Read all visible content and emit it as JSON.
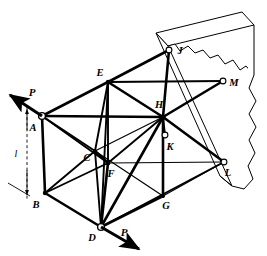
{
  "figure": {
    "type": "engineering-diagram",
    "background_color": "#ffffff",
    "line_color": "#000000"
  },
  "nodes": [
    {
      "id": "A",
      "label": "A",
      "x": 42,
      "y": 116,
      "label_x": 33,
      "label_y": 131,
      "marker": "pin",
      "note": "loaded joint, force P applied"
    },
    {
      "id": "B",
      "label": "B",
      "x": 45,
      "y": 193,
      "label_x": 36,
      "label_y": 208,
      "marker": "joint",
      "note": "lower left joint"
    },
    {
      "id": "C",
      "label": "C",
      "x": 95,
      "y": 151,
      "label_x": 87,
      "label_y": 161,
      "marker": "joint",
      "note": "interior upper joint"
    },
    {
      "id": "D",
      "label": "D",
      "x": 101,
      "y": 227,
      "label_x": 92,
      "label_y": 240,
      "marker": "pin",
      "note": "loaded joint, force P applied"
    },
    {
      "id": "E",
      "label": "E",
      "x": 108,
      "y": 82,
      "label_x": 99,
      "label_y": 76,
      "marker": "joint",
      "note": "top front joint"
    },
    {
      "id": "F",
      "label": "F",
      "x": 108,
      "y": 163,
      "label_x": 110,
      "label_y": 176,
      "marker": "joint",
      "note": "interior lower joint"
    },
    {
      "id": "G",
      "label": "G",
      "x": 163,
      "y": 196,
      "label_x": 165,
      "label_y": 208,
      "marker": "joint",
      "note": "lower rear joint"
    },
    {
      "id": "H",
      "label": "H",
      "x": 163,
      "y": 117,
      "label_x": 157,
      "label_y": 108,
      "marker": "joint",
      "note": "central upper rear joint"
    },
    {
      "id": "J",
      "label": "J",
      "x": 169,
      "y": 50,
      "label_x": 177,
      "label_y": 54,
      "marker": "pin-small",
      "note": "wall support, upper"
    },
    {
      "id": "K",
      "label": "K",
      "x": 165,
      "y": 135,
      "label_x": 168,
      "label_y": 148,
      "marker": "pin-small",
      "note": "wall support, middle"
    },
    {
      "id": "L",
      "label": "L",
      "x": 224,
      "y": 162,
      "label_x": 226,
      "label_y": 175,
      "marker": "pin-small",
      "note": "wall support, lower right"
    },
    {
      "id": "M",
      "label": "M",
      "x": 223,
      "y": 81,
      "label_x": 230,
      "label_y": 86,
      "marker": "pin-small",
      "note": "wall support, upper right"
    }
  ],
  "members": [
    {
      "from": "A",
      "to": "E",
      "weight": "thick"
    },
    {
      "from": "A",
      "to": "B",
      "weight": "thick"
    },
    {
      "from": "A",
      "to": "H",
      "weight": "thick"
    },
    {
      "from": "A",
      "to": "C",
      "weight": "med"
    },
    {
      "from": "A",
      "to": "F",
      "weight": "med"
    },
    {
      "from": "E",
      "to": "C",
      "weight": "med"
    },
    {
      "from": "E",
      "to": "H",
      "weight": "thick"
    },
    {
      "from": "E",
      "to": "J",
      "weight": "thick"
    },
    {
      "from": "E",
      "to": "M",
      "weight": "med"
    },
    {
      "from": "E",
      "to": "F",
      "weight": "med"
    },
    {
      "from": "E",
      "to": "D",
      "weight": "med"
    },
    {
      "from": "B",
      "to": "C",
      "weight": "med"
    },
    {
      "from": "B",
      "to": "D",
      "weight": "thick"
    },
    {
      "from": "B",
      "to": "F",
      "weight": "med"
    },
    {
      "from": "C",
      "to": "F",
      "weight": "thick"
    },
    {
      "from": "C",
      "to": "D",
      "weight": "med"
    },
    {
      "from": "C",
      "to": "G",
      "weight": "thin"
    },
    {
      "from": "F",
      "to": "D",
      "weight": "thick"
    },
    {
      "from": "F",
      "to": "H",
      "weight": "med"
    },
    {
      "from": "F",
      "to": "L",
      "weight": "thin"
    },
    {
      "from": "D",
      "to": "H",
      "weight": "thick"
    },
    {
      "from": "D",
      "to": "G",
      "weight": "thick"
    },
    {
      "from": "D",
      "to": "L",
      "weight": "med"
    },
    {
      "from": "H",
      "to": "G",
      "weight": "thick"
    },
    {
      "from": "H",
      "to": "J",
      "weight": "thick"
    },
    {
      "from": "H",
      "to": "M",
      "weight": "thick"
    },
    {
      "from": "H",
      "to": "L",
      "weight": "thick"
    },
    {
      "from": "H",
      "to": "K",
      "weight": "med"
    },
    {
      "from": "G",
      "to": "L",
      "weight": "thin"
    },
    {
      "from": "C",
      "to": "H",
      "weight": "thin"
    }
  ],
  "forces": [
    {
      "id": "P-upper",
      "label": "P",
      "applied_at": "A",
      "tip_x": 6,
      "tip_y": 92,
      "tail_x": 42,
      "tail_y": 116,
      "label_x": 32,
      "label_y": 95,
      "direction": "up-left"
    },
    {
      "id": "P-lower",
      "label": "P",
      "applied_at": "D",
      "tip_x": 143,
      "tip_y": 251,
      "tail_x": 101,
      "tail_y": 227,
      "label_x": 120,
      "label_y": 235,
      "direction": "down-right"
    }
  ],
  "dimension": {
    "label": "l",
    "label_x": 15,
    "label_y": 156,
    "top_x": 27,
    "top_y": 106,
    "bottom_x": 27,
    "bottom_y": 196,
    "description": "vertical dimension between the two applied forces"
  },
  "wall": {
    "description": "broken-away vertical wall slab with jagged torn edges",
    "face_fill": "#ffffff",
    "edge_color": "#000000",
    "top_face": "M 156,33 L 242,12 L 254,25 L 168,46 Z",
    "front_face": "M 156,33 L 168,46 L 168,47 L 232,186 L 220,176 Z",
    "torn_outline": "M 168,46 L 175,44 L 181,50 L 189,46 L 196,52 L 204,50 L 211,58 L 219,56 L 226,64 L 234,61 L 241,70 L 247,66 L 254,74 L 254,25",
    "right_edge": "M 254,74 L 250,88 L 256,100 L 249,113 L 255,126 L 248,139 L 254,152 L 247,165 L 252,178 L 243,188 L 232,186"
  }
}
